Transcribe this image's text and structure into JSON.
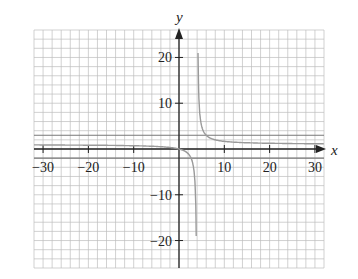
{
  "chart_data": {
    "type": "line",
    "title": "",
    "xlabel": "x",
    "ylabel": "y",
    "xlim": [
      -32,
      32
    ],
    "ylim": [
      -26,
      26
    ],
    "grid": true,
    "grid_step": 2,
    "x_ticks": [
      -30,
      -20,
      -10,
      10,
      20,
      30
    ],
    "y_ticks": [
      20,
      10,
      -10,
      -20
    ],
    "x_tick_labels": [
      "−30",
      "−20",
      "−10",
      "10",
      "20",
      "30"
    ],
    "y_tick_labels": [
      "20",
      "10",
      "−10",
      "−20"
    ],
    "asymptotes": {
      "vertical_x": 4,
      "horizontal_y": [
        3,
        -2
      ]
    },
    "series": [
      {
        "name": "rational function",
        "description": "hyperbola with vertical asymptote near x=4, approaching y≈1 as |x|→∞, passing through origin",
        "approx_formula": "y = x/(x-4)"
      }
    ],
    "colors": {
      "grid": "#bdbdbd",
      "axis": "#222222",
      "curve": "#9a9a9a"
    }
  }
}
